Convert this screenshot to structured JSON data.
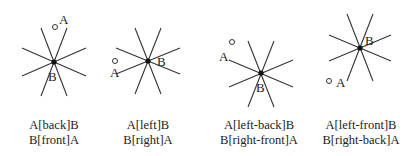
{
  "diagrams": [
    {
      "id": "back-front",
      "center": [
        54,
        62
      ],
      "point_a": {
        "label": "A",
        "circle": [
          55,
          27
        ],
        "text_pos": [
          59,
          24
        ]
      },
      "point_b": {
        "label": "B",
        "text_pos": [
          48,
          81
        ]
      },
      "caption": {
        "line1": "A[back]B",
        "line2": "B[front]A"
      }
    },
    {
      "id": "left-right",
      "center": [
        148,
        61
      ],
      "point_a": {
        "label": "A",
        "circle": [
          115,
          61
        ],
        "text_pos": [
          110,
          77
        ]
      },
      "point_b": {
        "label": "B",
        "text_pos": [
          157,
          66
        ]
      },
      "caption": {
        "line1": "A[left]B",
        "line2": "B[right]A"
      }
    },
    {
      "id": "left-back-right-front",
      "center": [
        261,
        73
      ],
      "point_a": {
        "label": "A",
        "circle": [
          232,
          42
        ],
        "text_pos": [
          219,
          61
        ]
      },
      "point_b": {
        "label": "B",
        "text_pos": [
          256,
          92
        ]
      },
      "caption": {
        "line1": "A[left-back]B",
        "line2": "B[right-front]A"
      }
    },
    {
      "id": "left-front-right-back",
      "center": [
        360,
        48
      ],
      "point_a": {
        "label": "A",
        "circle": [
          329,
          81
        ],
        "text_pos": [
          336,
          87
        ]
      },
      "point_b": {
        "label": "B",
        "text_pos": [
          365,
          45
        ]
      },
      "caption": {
        "line1": "A[left-front]B",
        "line2": "B[right-back]A"
      }
    }
  ],
  "style": {
    "line_color": "#333333",
    "point_color": "#111111"
  }
}
